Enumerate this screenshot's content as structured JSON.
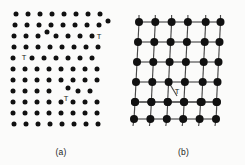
{
  "figure": {
    "background_color": "#fbfbfa",
    "atom_color": "#111111",
    "bond_color": "#4a4a4a"
  },
  "panels": [
    {
      "id": "a",
      "caption": "(a)",
      "style": "atoms-only",
      "defect_symbol": "T",
      "defect_count": 3
    },
    {
      "id": "b",
      "caption": "(b)",
      "style": "atoms-and-bonds",
      "defect_symbol": "T",
      "defect_count": 1
    }
  ],
  "chart_data": {
    "type": "scatter",
    "xlabel": "",
    "ylabel": "",
    "panel_a": {
      "type": "scatter",
      "caption": "(a)",
      "description": "Irregular dot lattice with three edge dislocations marked T",
      "radius": 2.5,
      "points": [
        [
          16,
          14
        ],
        [
          28,
          14
        ],
        [
          40,
          14
        ],
        [
          52,
          14
        ],
        [
          64,
          14
        ],
        [
          76,
          14
        ],
        [
          88,
          14
        ],
        [
          100,
          14
        ],
        [
          15,
          25
        ],
        [
          27,
          25
        ],
        [
          39,
          25
        ],
        [
          51,
          25
        ],
        [
          63,
          25
        ],
        [
          75,
          25
        ],
        [
          87,
          25
        ],
        [
          99,
          25
        ],
        [
          108,
          21
        ],
        [
          14,
          36
        ],
        [
          26,
          36
        ],
        [
          38,
          36
        ],
        [
          47,
          32
        ],
        [
          56,
          36
        ],
        [
          68,
          36
        ],
        [
          80,
          36
        ],
        [
          92,
          36
        ],
        [
          14,
          47
        ],
        [
          26,
          47
        ],
        [
          38,
          47
        ],
        [
          50,
          47
        ],
        [
          62,
          47
        ],
        [
          74,
          47
        ],
        [
          86,
          47
        ],
        [
          98,
          47
        ],
        [
          13,
          58
        ],
        [
          32,
          58
        ],
        [
          44,
          58
        ],
        [
          56,
          58
        ],
        [
          68,
          58
        ],
        [
          80,
          58
        ],
        [
          92,
          58
        ],
        [
          13,
          69
        ],
        [
          25,
          69
        ],
        [
          37,
          69
        ],
        [
          49,
          69
        ],
        [
          61,
          69
        ],
        [
          73,
          69
        ],
        [
          85,
          69
        ],
        [
          97,
          69
        ],
        [
          13,
          80
        ],
        [
          25,
          80
        ],
        [
          37,
          80
        ],
        [
          49,
          80
        ],
        [
          61,
          80
        ],
        [
          73,
          80
        ],
        [
          85,
          80
        ],
        [
          97,
          80
        ],
        [
          13,
          91
        ],
        [
          25,
          91
        ],
        [
          37,
          91
        ],
        [
          49,
          91
        ],
        [
          68,
          88
        ],
        [
          78,
          91
        ],
        [
          90,
          91
        ],
        [
          13,
          102
        ],
        [
          25,
          102
        ],
        [
          37,
          102
        ],
        [
          49,
          102
        ],
        [
          61,
          102
        ],
        [
          73,
          102
        ],
        [
          85,
          102
        ],
        [
          97,
          102
        ],
        [
          13,
          113
        ],
        [
          25,
          113
        ],
        [
          37,
          113
        ],
        [
          49,
          113
        ],
        [
          61,
          113
        ],
        [
          73,
          113
        ],
        [
          85,
          113
        ],
        [
          97,
          113
        ],
        [
          14,
          124
        ],
        [
          26,
          124
        ],
        [
          38,
          124
        ],
        [
          50,
          124
        ],
        [
          62,
          124
        ],
        [
          74,
          124
        ],
        [
          86,
          124
        ],
        [
          98,
          124
        ]
      ],
      "defects": [
        {
          "label": "T",
          "x": 99,
          "y": 37
        },
        {
          "label": "T",
          "x": 24,
          "y": 58
        },
        {
          "label": "T",
          "x": 66,
          "y": 99
        }
      ]
    },
    "panel_b": {
      "type": "scatter",
      "caption": "(b)",
      "description": "Bonded lattice network with one edge dislocation marked T",
      "radius": 4,
      "columns": 6,
      "rows": 7,
      "nodes": [
        [
          17,
          22
        ],
        [
          38,
          22
        ],
        [
          59,
          22
        ],
        [
          80,
          22
        ],
        [
          99,
          22
        ],
        [
          101,
          22
        ],
        [
          16,
          42
        ],
        [
          37,
          42
        ],
        [
          58,
          42
        ],
        [
          79,
          42
        ],
        [
          97,
          42
        ],
        [
          15,
          62
        ],
        [
          36,
          62
        ],
        [
          57,
          62
        ],
        [
          78,
          62
        ],
        [
          96,
          62
        ],
        [
          14,
          82
        ],
        [
          35,
          82
        ],
        [
          56,
          82
        ],
        [
          77,
          82
        ],
        [
          95,
          82
        ],
        [
          13,
          102
        ],
        [
          31,
          102
        ],
        [
          48,
          102
        ],
        [
          64,
          102
        ],
        [
          80,
          102
        ],
        [
          95,
          102
        ],
        [
          12,
          118
        ],
        [
          30,
          118
        ],
        [
          47,
          118
        ],
        [
          63,
          118
        ],
        [
          79,
          118
        ],
        [
          94,
          118
        ]
      ],
      "defects": [
        {
          "label": "T",
          "x": 55,
          "y": 92
        }
      ]
    }
  }
}
